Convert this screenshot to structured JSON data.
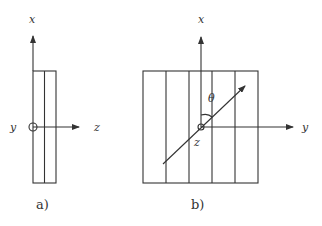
{
  "panel_a": {
    "caption": "a)",
    "axis_labels": {
      "vertical": "x",
      "horizontal": "z",
      "out_of_plane": "y"
    }
  },
  "panel_b": {
    "caption": "b)",
    "axis_labels": {
      "vertical": "x",
      "horizontal": "y",
      "out_of_plane": "z"
    },
    "angle_label": "θ"
  },
  "colors": {
    "stroke": "#333333",
    "background": "#ffffff"
  }
}
